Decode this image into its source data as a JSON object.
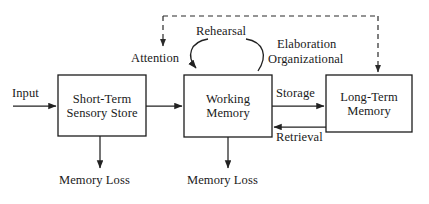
{
  "diagram": {
    "background_color": "#ffffff",
    "line_color": "#222222",
    "text_color": "#1a1a1a",
    "nodes": [
      {
        "id": "sensory_store",
        "label_line1": "Short-Term",
        "label_line2": "Sensory Store",
        "x": 58,
        "y": 75,
        "w": 88,
        "h": 61
      },
      {
        "id": "working_memory",
        "label_line1": "Working",
        "label_line2": "Memory",
        "x": 184,
        "y": 75,
        "w": 88,
        "h": 62
      },
      {
        "id": "long_term_memory",
        "label_line1": "Long-Term",
        "label_line2": "Memory",
        "x": 326,
        "y": 75,
        "w": 86,
        "h": 57
      }
    ],
    "edge_labels": [
      {
        "id": "input",
        "text": "Input",
        "x": 12,
        "y": 86
      },
      {
        "id": "attention",
        "text": "Attention",
        "x": 131,
        "y": 51
      },
      {
        "id": "rehearsal",
        "text": "Rehearsal",
        "x": 196,
        "y": 24
      },
      {
        "id": "elaboration",
        "text": "Elaboration",
        "x": 277,
        "y": 37
      },
      {
        "id": "organizational",
        "text": "Organizational",
        "x": 268,
        "y": 52
      },
      {
        "id": "storage",
        "text": "Storage",
        "x": 276,
        "y": 86
      },
      {
        "id": "retrieval",
        "text": "Retrieval",
        "x": 276,
        "y": 130
      },
      {
        "id": "memory_loss_sensory",
        "text": "Memory Loss",
        "x": 59,
        "y": 173
      },
      {
        "id": "memory_loss_working",
        "text": "Memory Loss",
        "x": 187,
        "y": 173
      }
    ],
    "connections": [
      {
        "id": "input-to-sensory",
        "from": "Input",
        "to": "Short-Term Sensory Store",
        "style": "solid"
      },
      {
        "id": "sensory-to-working",
        "from": "Short-Term Sensory Store",
        "to": "Working Memory",
        "style": "solid"
      },
      {
        "id": "working-to-longterm",
        "from": "Working Memory",
        "to": "Long-Term Memory",
        "label": "Storage",
        "style": "solid"
      },
      {
        "id": "longterm-to-working",
        "from": "Long-Term Memory",
        "to": "Working Memory",
        "label": "Retrieval",
        "style": "solid"
      },
      {
        "id": "sensory-to-loss",
        "from": "Short-Term Sensory Store",
        "to": "Memory Loss",
        "style": "solid"
      },
      {
        "id": "working-to-loss",
        "from": "Working Memory",
        "to": "Memory Loss",
        "style": "solid"
      },
      {
        "id": "rehearsal-loop",
        "from": "Working Memory",
        "to": "Working Memory",
        "label": "Rehearsal",
        "style": "solid-arc"
      },
      {
        "id": "control-to-attention",
        "from": "control bus",
        "to": "Attention",
        "style": "dashed"
      },
      {
        "id": "control-to-longterm",
        "from": "control bus",
        "to": "Long-Term Memory",
        "style": "dashed"
      }
    ]
  }
}
